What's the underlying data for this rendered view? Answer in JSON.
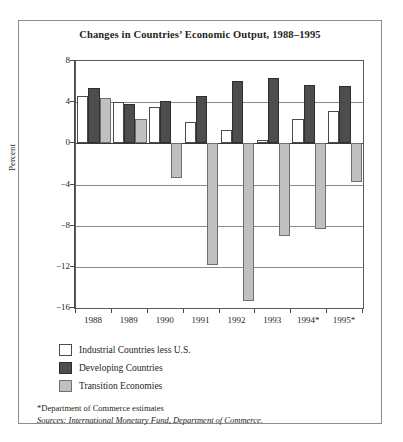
{
  "chart_data": {
    "type": "bar",
    "title": "Changes in Countries’ Economic Output, 1988–1995",
    "xlabel": "",
    "ylabel": "Percent",
    "ylim": [
      -16,
      8
    ],
    "yticks": [
      8,
      4,
      0,
      -4,
      -8,
      -12,
      -16
    ],
    "ytick_labels": [
      "8",
      "4",
      "0",
      "−4",
      "−8",
      "−12",
      "−16"
    ],
    "grid": true,
    "legend_position": "below-left",
    "categories": [
      "1988",
      "1989",
      "1990",
      "1991",
      "1992",
      "1993",
      "1994*",
      "1995*"
    ],
    "series": [
      {
        "name": "Industrial Countries less U.S.",
        "color": "#ffffff",
        "values": [
          4.6,
          4.0,
          3.5,
          2.1,
          1.3,
          0.3,
          2.4,
          3.1
        ]
      },
      {
        "name": "Developing Countries",
        "color": "#4d4d4d",
        "values": [
          5.4,
          3.8,
          4.1,
          4.6,
          6.1,
          6.3,
          5.7,
          5.6
        ]
      },
      {
        "name": "Transition Economies",
        "color": "#c0c0c0",
        "values": [
          4.4,
          2.4,
          -3.4,
          -11.8,
          -15.3,
          -9.0,
          -8.3,
          -3.8
        ]
      }
    ],
    "notes": {
      "estimates": "*Department of Commerce estimates",
      "sources": "Sources: International Monetary Fund, Department of Commerce."
    }
  },
  "legend": {
    "items": [
      {
        "label": "Industrial Countries less U.S.",
        "swatch": "industrial"
      },
      {
        "label": "Developing Countries",
        "swatch": "developing"
      },
      {
        "label": "Transition Economies",
        "swatch": "transition"
      }
    ]
  }
}
